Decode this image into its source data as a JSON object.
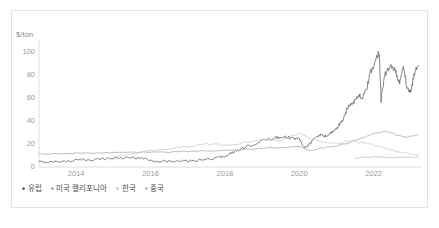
{
  "chart_data": {
    "type": "line",
    "title": "",
    "subtitle": "",
    "ylabel": "$/ton",
    "xlabel": "",
    "unit_label": "$/ton",
    "ylim": [
      0,
      110
    ],
    "xlim": [
      2013.0,
      2023.3
    ],
    "yticks": [
      0,
      20,
      40,
      60,
      80,
      100
    ],
    "ytick_labels": [
      "0",
      "20",
      "40",
      "60",
      "80",
      "100"
    ],
    "xticks": [
      2014,
      2016,
      2018,
      2020,
      2022
    ],
    "xtick_labels": [
      "2014",
      "2016",
      "2018",
      "2020",
      "2022"
    ],
    "grid": false,
    "legend_position": "bottom-left",
    "colors": {
      "europe": "#6b6f7a",
      "us_california": "#a8acb5",
      "korea": "#b9cfe0",
      "china": "#cbb8cf"
    },
    "series": [
      {
        "name": "유럽",
        "key": "europe",
        "color": "#6b6f7a",
        "x": [
          2013.0,
          2013.25,
          2013.5,
          2013.75,
          2014.0,
          2014.25,
          2014.5,
          2014.75,
          2015.0,
          2015.25,
          2015.5,
          2015.75,
          2016.0,
          2016.25,
          2016.5,
          2016.75,
          2017.0,
          2017.25,
          2017.5,
          2017.75,
          2018.0,
          2018.2,
          2018.4,
          2018.6,
          2018.8,
          2019.0,
          2019.2,
          2019.4,
          2019.6,
          2019.8,
          2020.0,
          2020.15,
          2020.3,
          2020.45,
          2020.6,
          2020.75,
          2020.9,
          2021.0,
          2021.1,
          2021.2,
          2021.3,
          2021.4,
          2021.5,
          2021.6,
          2021.7,
          2021.8,
          2021.9,
          2022.0,
          2022.1,
          2022.15,
          2022.2,
          2022.3,
          2022.4,
          2022.5,
          2022.6,
          2022.7,
          2022.8,
          2022.9,
          2023.0,
          2023.1,
          2023.2
        ],
        "y": [
          4.5,
          4.2,
          4.8,
          5.0,
          6.0,
          6.2,
          6.5,
          7.2,
          7.5,
          7.8,
          8.2,
          8.0,
          5.5,
          5.2,
          4.6,
          5.0,
          5.2,
          5.5,
          6.5,
          7.8,
          9.5,
          12.5,
          15.0,
          17.5,
          20.0,
          22.5,
          24.5,
          25.5,
          26.5,
          25.0,
          24.0,
          17.0,
          21.0,
          26.0,
          28.0,
          26.5,
          31.0,
          33.0,
          38.0,
          42.0,
          52.0,
          55.0,
          58.0,
          62.0,
          60.0,
          66.0,
          80.0,
          88.0,
          96.0,
          100.5,
          58.0,
          80.0,
          84.0,
          88.0,
          82.0,
          72.0,
          88.0,
          68.0,
          65.0,
          82.0,
          88.0
        ]
      },
      {
        "name": "미국 캘리포니아",
        "key": "us_california",
        "color": "#a8acb5",
        "x": [
          2013.0,
          2013.5,
          2014.0,
          2014.5,
          2015.0,
          2015.5,
          2016.0,
          2016.5,
          2017.0,
          2017.5,
          2018.0,
          2018.5,
          2019.0,
          2019.5,
          2020.0,
          2020.3,
          2020.6,
          2021.0,
          2021.3,
          2021.6,
          2022.0,
          2022.3,
          2022.6,
          2022.9,
          2023.1,
          2023.2
        ],
        "y": [
          11.0,
          11.5,
          12.0,
          12.2,
          12.5,
          12.6,
          12.8,
          13.0,
          13.5,
          14.0,
          14.5,
          15.0,
          16.5,
          17.0,
          17.5,
          14.0,
          16.5,
          18.0,
          21.0,
          24.0,
          29.0,
          31.0,
          28.0,
          26.0,
          27.5,
          28.0
        ]
      },
      {
        "name": "한국",
        "key": "korea",
        "color": "#b9cfe0",
        "x": [
          2015.0,
          2015.5,
          2016.0,
          2016.5,
          2017.0,
          2017.5,
          2018.0,
          2018.5,
          2019.0,
          2019.5,
          2020.0,
          2020.3,
          2020.6,
          2021.0,
          2021.3,
          2021.6,
          2022.0,
          2022.3,
          2022.6,
          2022.9,
          2023.1,
          2023.2
        ],
        "y": [
          8.5,
          11.0,
          14.5,
          16.0,
          17.5,
          20.0,
          19.0,
          21.0,
          24.5,
          23.0,
          29.0,
          25.0,
          22.0,
          20.0,
          22.5,
          21.5,
          19.0,
          16.0,
          13.5,
          12.0,
          10.5,
          10.0
        ]
      },
      {
        "name": "중국",
        "key": "china",
        "color": "#cbb8cf",
        "x": [
          2021.5,
          2021.7,
          2021.9,
          2022.1,
          2022.3,
          2022.5,
          2022.7,
          2022.9,
          2023.0,
          2023.1,
          2023.2
        ],
        "y": [
          7.5,
          8.2,
          8.5,
          8.8,
          8.5,
          8.0,
          8.4,
          8.6,
          8.5,
          8.3,
          8.2
        ]
      }
    ]
  },
  "legend": {
    "items": [
      {
        "label": "유럽",
        "color": "#6b6f7a"
      },
      {
        "label": "미국 캘리포니아",
        "color": "#a8acb5"
      },
      {
        "label": "한국",
        "color": "#b9cfe0"
      },
      {
        "label": "중국",
        "color": "#cbb8cf"
      }
    ]
  }
}
